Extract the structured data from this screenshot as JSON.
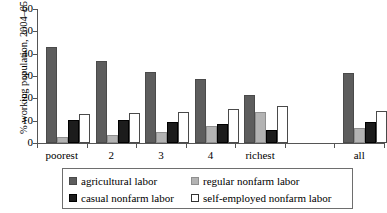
{
  "chart_data": {
    "type": "bar",
    "title": "",
    "xlabel": "",
    "ylabel": "% working population, 2004–05",
    "ylim": [
      0,
      60
    ],
    "yticks": [
      0,
      10,
      20,
      30,
      40,
      50,
      60
    ],
    "grid": false,
    "legend_position": "bottom",
    "categories": [
      "poorest",
      "2",
      "3",
      "4",
      "richest",
      "all"
    ],
    "series": [
      {
        "name": "agricultural labor",
        "color": "#5d5d5d",
        "values": [
          43.0,
          36.5,
          32.0,
          28.5,
          21.5,
          31.5
        ]
      },
      {
        "name": "regular nonfarm labor",
        "color": "#b3b3b3",
        "values": [
          2.5,
          3.5,
          5.0,
          7.5,
          14.0,
          6.5
        ]
      },
      {
        "name": "casual nonfarm labor",
        "color": "#1c1c1c",
        "values": [
          10.5,
          10.3,
          9.5,
          8.5,
          6.0,
          9.5
        ]
      },
      {
        "name": "self-employed nonfarm labor",
        "color": "#ffffff",
        "values": [
          13.0,
          13.3,
          14.0,
          15.3,
          16.5,
          14.5
        ]
      }
    ]
  },
  "axis": {
    "y_title": "% working population, 2004–05",
    "y_tick_labels": [
      "60",
      "50",
      "40",
      "30",
      "20",
      "10",
      "0"
    ],
    "x_tick_labels": [
      "poorest",
      "2",
      "3",
      "4",
      "richest",
      "all"
    ]
  },
  "legend": {
    "entries": [
      {
        "label": "agricultural labor",
        "swatch": "dark-gray"
      },
      {
        "label": "regular nonfarm labor",
        "swatch": "light-gray"
      },
      {
        "label": "casual nonfarm labor",
        "swatch": "black"
      },
      {
        "label": "self-employed nonfarm labor",
        "swatch": "white"
      }
    ]
  }
}
